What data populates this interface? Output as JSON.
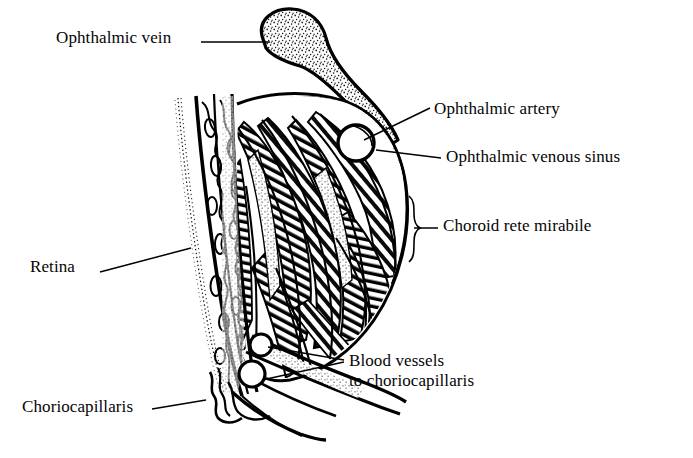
{
  "figure": {
    "type": "anatomical-line-drawing",
    "background_color": "#ffffff",
    "ink_color": "#000000"
  },
  "labels": {
    "ophthalmic_vein": "Ophthalmic vein",
    "ophthalmic_artery": "Ophthalmic artery",
    "ophthalmic_venous_sinus": "Ophthalmic venous sinus",
    "choroid_rete_mirabile": "Choroid rete mirabile",
    "retina": "Retina",
    "choriocapillaris": "Choriocapillaris",
    "blood_vessels_to_choriocapillaris": "Blood vessels\nto choriocapillaris"
  },
  "structures": [
    {
      "name": "ophthalmic-vein",
      "rendering": "stippled club-shaped vessel, hooked, upper centre"
    },
    {
      "name": "ophthalmic-artery",
      "rendering": "white circular vessel lumen outlined in black"
    },
    {
      "name": "ophthalmic-venous-sinus",
      "rendering": "stippled crescent region surrounding artery"
    },
    {
      "name": "choroid-rete-mirabile",
      "rendering": "dense parallel hatched vessel bundles"
    },
    {
      "name": "retina",
      "rendering": "stippled outer margin with wavy vertical cell layers"
    },
    {
      "name": "choriocapillaris",
      "rendering": "scalloped wavy capillary layer at lower margin"
    },
    {
      "name": "blood-vessels-to-choriocapillaris",
      "rendering": "two white circular lumens at lower apex"
    }
  ],
  "leaders": {
    "brace": "curly brace spanning the choroid rete mirabile"
  }
}
